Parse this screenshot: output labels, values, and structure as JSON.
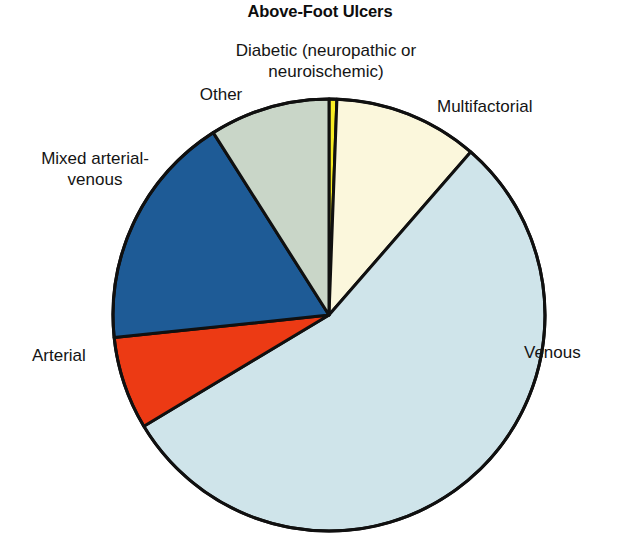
{
  "chart_data": {
    "type": "pie",
    "title": "Above-Foot Ulcers",
    "subtitle": "",
    "xlabel": "",
    "ylabel": "",
    "legend_position": "none",
    "grid": false,
    "labels_outside": true,
    "categories": [
      "Diabetic (neuropathic or neuroischemic)",
      "Multifactorial",
      "Venous",
      "Arterial",
      "Mixed arterial-venous",
      "Other"
    ],
    "values": [
      0.6,
      10.8,
      55.0,
      7.0,
      17.7,
      8.9
    ],
    "units": "percent",
    "slices": [
      {
        "label": "Diabetic (neuropathic or neuroischemic)",
        "value": 0.6,
        "color": "#f7ec24",
        "start_angle_deg": 0.0,
        "end_angle_deg": 2.1
      },
      {
        "label": "Multifactorial",
        "value": 10.8,
        "color": "#fbf7dc",
        "start_angle_deg": 2.1,
        "end_angle_deg": 41.0
      },
      {
        "label": "Venous",
        "value": 55.0,
        "color": "#cfe4ea",
        "start_angle_deg": 41.0,
        "end_angle_deg": 239.0
      },
      {
        "label": "Arterial",
        "value": 7.0,
        "color": "#ec3a14",
        "start_angle_deg": 239.0,
        "end_angle_deg": 264.0
      },
      {
        "label": "Mixed arterial-venous",
        "value": 17.7,
        "color": "#1e5b96",
        "start_angle_deg": 264.0,
        "end_angle_deg": 327.6
      },
      {
        "label": "Other",
        "value": 8.9,
        "color": "#c9d6c8",
        "start_angle_deg": 327.6,
        "end_angle_deg": 360.0
      }
    ],
    "geometry": {
      "center_x": 329,
      "center_y": 315,
      "radius": 216,
      "stroke_color": "#101010",
      "stroke_width": 3,
      "background": "#ffffff"
    }
  },
  "labels": {
    "diabetic": "Diabetic (neuropathic or\nneuroischemic)",
    "other": "Other",
    "multifactorial": "Multifactorial",
    "mixed": "Mixed arterial-\nvenous",
    "arterial": "Arterial",
    "venous": "Venous"
  }
}
